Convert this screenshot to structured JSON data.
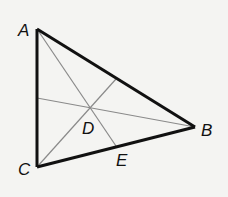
{
  "diagram": {
    "type": "triangle-with-cevians",
    "points": {
      "A": {
        "label": "A"
      },
      "B": {
        "label": "B"
      },
      "C": {
        "label": "C"
      },
      "D": {
        "label": "D"
      },
      "E": {
        "label": "E"
      }
    },
    "sides": [
      "AB",
      "BC",
      "CA"
    ],
    "cevians": [
      "AE",
      "B-to-CA",
      "C-to-AB"
    ],
    "intersection": "D",
    "colors": {
      "side": "#111111",
      "cevian": "#8a8a8a",
      "background": "#f4f4f2"
    }
  }
}
